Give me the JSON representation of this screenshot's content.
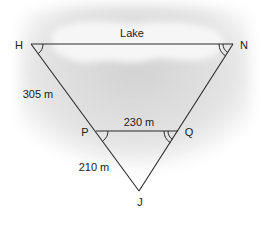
{
  "diagram": {
    "region_label": "Lake",
    "points": {
      "H": {
        "label": "H",
        "x": 31,
        "y": 44
      },
      "N": {
        "label": "N",
        "x": 233,
        "y": 44
      },
      "P": {
        "label": "P",
        "x": 96,
        "y": 131
      },
      "Q": {
        "label": "Q",
        "x": 178,
        "y": 131
      },
      "J": {
        "label": "J",
        "x": 139,
        "y": 191
      }
    },
    "measurements": {
      "HP": "305 m",
      "PQ": "230 m",
      "PJ": "210 m"
    },
    "angle_marks": {
      "single_arc": [
        "H",
        "P"
      ],
      "double_arc": [
        "N",
        "Q"
      ]
    },
    "colors": {
      "line": "#2a2a2a",
      "background_shade": "#d8d8d8",
      "lake": "#f4f4f4"
    }
  }
}
